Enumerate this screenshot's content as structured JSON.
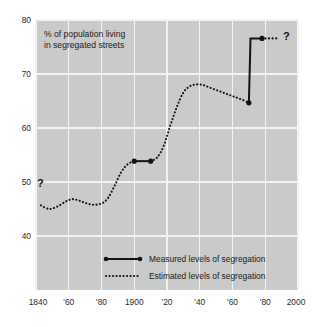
{
  "chart_data": {
    "type": "line",
    "title": "% of population living in segregated streets",
    "title_line1": "% of population living",
    "title_line2": "in segregated streets",
    "xlabel": "",
    "ylabel": "",
    "xlim": [
      1840,
      2000
    ],
    "ylim": [
      36,
      80
    ],
    "grid": true,
    "background_color": "#cacaca",
    "gridline_color": "#f2f2f2",
    "line_color": "#141414",
    "x_ticks": [
      1840,
      1860,
      1880,
      1900,
      1920,
      1940,
      1960,
      1980,
      2000
    ],
    "x_tick_labels": [
      "1840",
      "'60",
      "'80",
      "1900",
      "'20",
      "'40",
      "'60",
      "'80",
      "2000"
    ],
    "y_ticks": [
      40,
      50,
      60,
      70,
      80
    ],
    "y_tick_labels": [
      "40",
      "50",
      "60",
      "70",
      "80"
    ],
    "legend_position": "bottom-center",
    "legend": [
      {
        "label": "Measured levels of segregation",
        "style": "solid-with-endpoints"
      },
      {
        "label": "Estimated levels of segregation",
        "style": "dotted"
      }
    ],
    "annotations": [
      {
        "text": "?",
        "x": 1841,
        "y": 50.0,
        "note": "uncertainty marker at left edge of series"
      },
      {
        "text": "?",
        "x": 1990,
        "y": 77.0,
        "note": "uncertainty marker after last measured point"
      }
    ],
    "series": [
      {
        "name": "Estimated levels of segregation",
        "style": "dotted",
        "x": [
          1843,
          1848,
          1853,
          1858,
          1862,
          1866,
          1870,
          1875,
          1880,
          1884,
          1888,
          1892,
          1896,
          1900
        ],
        "values": [
          49.8,
          49.2,
          49.6,
          50.4,
          50.8,
          50.6,
          50.2,
          49.9,
          50.1,
          51.0,
          53.0,
          55.2,
          56.5,
          57.0
        ]
      },
      {
        "name": "Measured levels of segregation",
        "style": "solid",
        "x": [
          1900,
          1910
        ],
        "values": [
          57.0,
          57.0
        ]
      },
      {
        "name": "Estimated levels of segregation",
        "style": "dotted",
        "x": [
          1910,
          1914,
          1918,
          1922,
          1926,
          1930,
          1934,
          1938,
          1942,
          1946,
          1950,
          1954,
          1958,
          1962,
          1966,
          1970
        ],
        "values": [
          57.0,
          57.6,
          59.5,
          62.8,
          65.8,
          68.2,
          69.2,
          69.5,
          69.4,
          69.0,
          68.6,
          68.2,
          67.8,
          67.4,
          67.0,
          66.5
        ]
      },
      {
        "name": "Measured levels of segregation",
        "style": "solid",
        "x": [
          1970,
          1971,
          1978
        ],
        "values": [
          66.5,
          77.0,
          77.0
        ]
      },
      {
        "name": "Estimated levels of segregation",
        "style": "dotted",
        "x": [
          1978,
          1987
        ],
        "values": [
          77.0,
          77.0
        ]
      }
    ]
  }
}
